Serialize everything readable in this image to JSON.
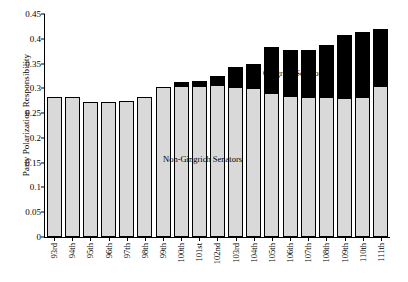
{
  "chart_data": {
    "type": "bar",
    "title": "",
    "xlabel": "",
    "ylabel": "Party Polarization Responsibility",
    "ylim": [
      0,
      0.45
    ],
    "ytick_labels": [
      "0",
      "0.05",
      "0.1",
      "0.15",
      "0.2",
      "0.25",
      "0.3",
      "0.35",
      "0.4",
      "0.45"
    ],
    "ytick_values": [
      0,
      0.05,
      0.1,
      0.15,
      0.2,
      0.25,
      0.3,
      0.35,
      0.4,
      0.45
    ],
    "grid": false,
    "legend_position": "inline-annotations",
    "categories": [
      "93rd",
      "94th",
      "95th",
      "96th",
      "97th",
      "98th",
      "99th",
      "100th",
      "101st",
      "102nd",
      "103rd",
      "104th",
      "105th",
      "106th",
      "107th",
      "108th",
      "109th",
      "110th",
      "111th"
    ],
    "series": [
      {
        "name": "Non-Gingrich Senators",
        "color": "#d9d9d9",
        "values": [
          0.283,
          0.283,
          0.272,
          0.272,
          0.275,
          0.283,
          0.303,
          0.305,
          0.305,
          0.307,
          0.303,
          0.3,
          0.29,
          0.285,
          0.283,
          0.283,
          0.28,
          0.283,
          0.305
        ]
      },
      {
        "name": "Gingrich Senators",
        "color": "#000000",
        "values": [
          0,
          0,
          0,
          0,
          0,
          0,
          0,
          0.007,
          0.01,
          0.018,
          0.04,
          0.05,
          0.093,
          0.092,
          0.095,
          0.105,
          0.128,
          0.13,
          0.115
        ]
      }
    ],
    "totals": [
      0.283,
      0.283,
      0.272,
      0.272,
      0.275,
      0.283,
      0.303,
      0.312,
      0.315,
      0.325,
      0.343,
      0.35,
      0.383,
      0.377,
      0.378,
      0.388,
      0.408,
      0.413,
      0.42
    ],
    "annotations": [
      {
        "name": "gingrich-senators-label",
        "text": "Gingrich Senators"
      },
      {
        "name": "non-gingrich-senators-label",
        "text": "Non-Gingrich Senators"
      }
    ]
  }
}
